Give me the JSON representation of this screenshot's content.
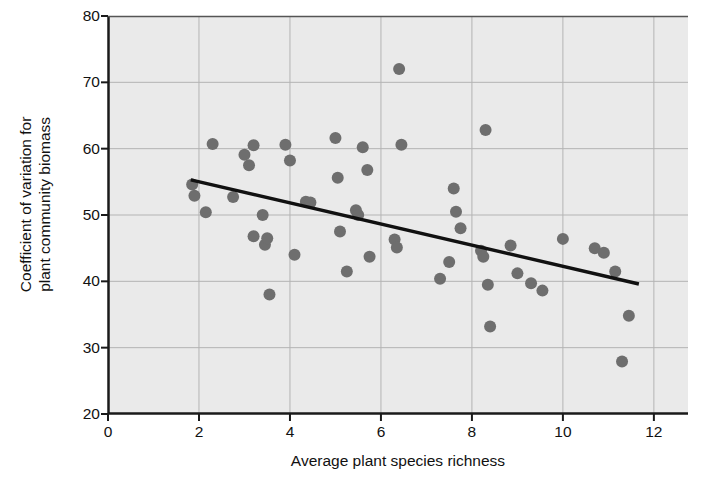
{
  "chart_data": {
    "type": "scatter",
    "title": "",
    "xlabel": "Average plant species richness",
    "ylabel": "Coefficient of variation for\nplant community biomass",
    "xlim": [
      0,
      12.75
    ],
    "ylim": [
      20,
      80
    ],
    "xticks": [
      0,
      2,
      4,
      6,
      8,
      10,
      12
    ],
    "yticks": [
      20,
      30,
      40,
      50,
      60,
      70,
      80
    ],
    "xtick_labels": [
      "0",
      "2",
      "4",
      "6",
      "8",
      "10",
      "12"
    ],
    "ytick_labels": [
      "20",
      "30",
      "40",
      "50",
      "60",
      "70",
      "80"
    ],
    "grid": true,
    "legend": "none",
    "plot_bg_color": "#eaeaea",
    "point_color": "#6e6e6e",
    "line_color": "#111111",
    "point_radius_px": 6,
    "points": [
      [
        1.85,
        54.6
      ],
      [
        1.9,
        52.9
      ],
      [
        2.15,
        50.4
      ],
      [
        2.3,
        60.7
      ],
      [
        2.75,
        52.7
      ],
      [
        3.0,
        59.1
      ],
      [
        3.1,
        57.5
      ],
      [
        3.2,
        60.5
      ],
      [
        3.2,
        46.8
      ],
      [
        3.4,
        50.0
      ],
      [
        3.45,
        45.5
      ],
      [
        3.5,
        46.5
      ],
      [
        3.55,
        38.0
      ],
      [
        3.9,
        60.6
      ],
      [
        4.0,
        58.2
      ],
      [
        4.1,
        44.0
      ],
      [
        4.35,
        52.0
      ],
      [
        4.45,
        51.9
      ],
      [
        5.0,
        61.6
      ],
      [
        5.05,
        55.6
      ],
      [
        5.1,
        47.5
      ],
      [
        5.25,
        41.5
      ],
      [
        5.45,
        50.7
      ],
      [
        5.5,
        50.0
      ],
      [
        5.6,
        60.2
      ],
      [
        5.7,
        56.8
      ],
      [
        5.75,
        43.7
      ],
      [
        6.3,
        46.3
      ],
      [
        6.35,
        45.1
      ],
      [
        6.4,
        72.0
      ],
      [
        6.45,
        60.6
      ],
      [
        7.3,
        40.4
      ],
      [
        7.5,
        42.9
      ],
      [
        7.6,
        54.0
      ],
      [
        7.65,
        50.5
      ],
      [
        7.75,
        48.0
      ],
      [
        8.2,
        44.6
      ],
      [
        8.25,
        43.7
      ],
      [
        8.3,
        62.8
      ],
      [
        8.35,
        39.5
      ],
      [
        8.4,
        33.2
      ],
      [
        8.85,
        45.4
      ],
      [
        9.0,
        41.2
      ],
      [
        9.3,
        39.7
      ],
      [
        9.55,
        38.6
      ],
      [
        10.0,
        46.4
      ],
      [
        10.7,
        45.0
      ],
      [
        10.9,
        44.3
      ],
      [
        11.15,
        41.5
      ],
      [
        11.3,
        27.9
      ],
      [
        11.45,
        34.8
      ]
    ],
    "trend_line": {
      "x1": 1.82,
      "y1": 55.3,
      "x2": 11.67,
      "y2": 39.6
    }
  }
}
